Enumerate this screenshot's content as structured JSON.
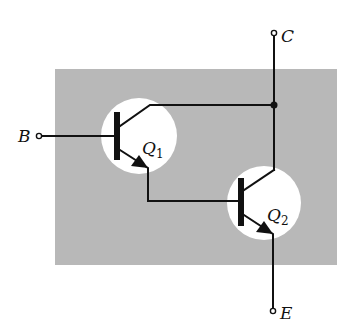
{
  "diagram": {
    "background_box": {
      "x": 55,
      "y": 69,
      "width": 282,
      "height": 196,
      "color": "#b8b8b8"
    },
    "wire_color": "#111111",
    "terminals": {
      "base": {
        "label": "B",
        "x": 39,
        "y": 136
      },
      "collector": {
        "label": "C",
        "x": 274,
        "y": 33
      },
      "emitter": {
        "label": "E",
        "x": 273,
        "y": 311
      }
    },
    "transistors": [
      {
        "id": "Q1",
        "label": "Q",
        "subscript": "1",
        "type": "NPN",
        "cx": 139,
        "cy": 136,
        "r": 38
      },
      {
        "id": "Q2",
        "label": "Q",
        "subscript": "2",
        "type": "NPN",
        "cx": 264,
        "cy": 203,
        "r": 37
      }
    ],
    "junction": {
      "x": 274,
      "y": 105
    }
  }
}
